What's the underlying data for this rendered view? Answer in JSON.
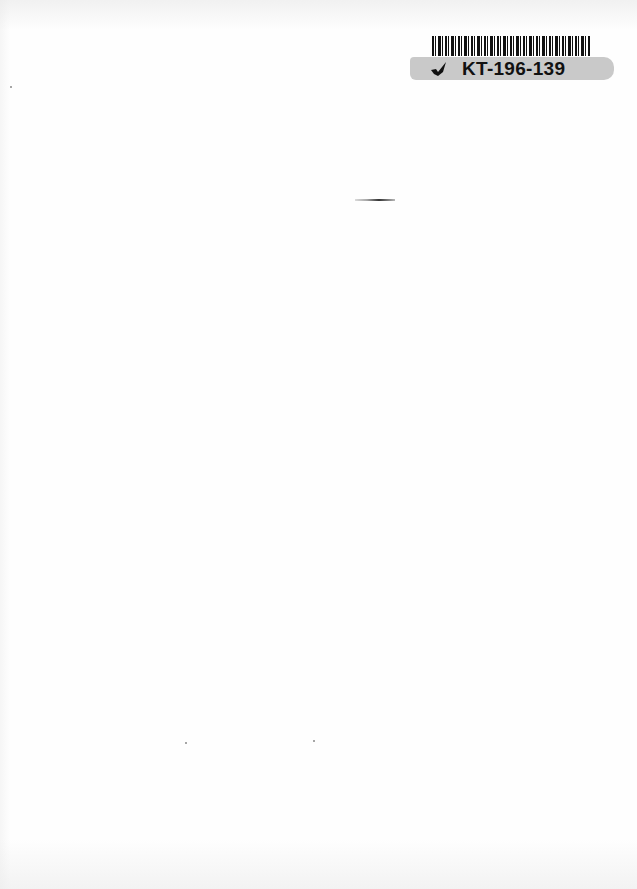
{
  "document": {
    "type": "scanned blank page",
    "label": {
      "barcode_code": "KT-196-139",
      "icon": "check-mark-icon"
    }
  }
}
